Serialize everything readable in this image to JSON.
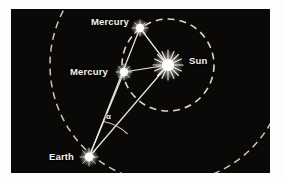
{
  "figure": {
    "type": "astronomy-orbit-diagram",
    "background_color": "#0a0908",
    "line_color": "#e8e6e0",
    "label_color": "#f2f1ee",
    "frame_color": "#fdfdfd",
    "width": 283,
    "height": 182
  },
  "labels": {
    "mercury_top": "Mercury",
    "mercury_mid": "Mercury",
    "sun": "Sun",
    "earth": "Earth",
    "angle": "α"
  },
  "bodies": [
    {
      "name": "mercury-top",
      "label": "Mercury",
      "x": 140,
      "y": 28,
      "r": 4.2,
      "kind": "planet"
    },
    {
      "name": "mercury-mid",
      "label": "Mercury",
      "x": 124,
      "y": 72,
      "r": 4.2,
      "kind": "planet"
    },
    {
      "name": "sun",
      "label": "Sun",
      "x": 168,
      "y": 65,
      "r": 6.0,
      "kind": "star"
    },
    {
      "name": "earth",
      "label": "Earth",
      "x": 89,
      "y": 157,
      "r": 4.4,
      "kind": "planet"
    }
  ],
  "orbits": [
    {
      "name": "mercury-orbit",
      "cx": 168,
      "cy": 65,
      "r": 46,
      "style": "dashed"
    },
    {
      "name": "earth-orbit-left-arc",
      "cx": 168,
      "cy": 65,
      "r": 108,
      "style": "dashed"
    }
  ],
  "sight_lines": [
    {
      "name": "earth-to-mercury-top",
      "from": "earth",
      "to": "mercury-top"
    },
    {
      "name": "earth-to-mercury-mid",
      "from": "earth",
      "to": "mercury-mid"
    },
    {
      "name": "earth-to-sun",
      "from": "earth",
      "to": "sun"
    },
    {
      "name": "mercury-top-to-sun",
      "from": "mercury-top",
      "to": "sun"
    },
    {
      "name": "mercury-mid-to-sun",
      "from": "mercury-mid",
      "to": "sun"
    }
  ],
  "angle_marker": {
    "name": "elongation-angle",
    "symbol": "α",
    "vertex": "earth",
    "between": [
      "earth-to-mercury-mid",
      "earth-to-sun"
    ],
    "label_x": 107,
    "label_y": 114
  }
}
